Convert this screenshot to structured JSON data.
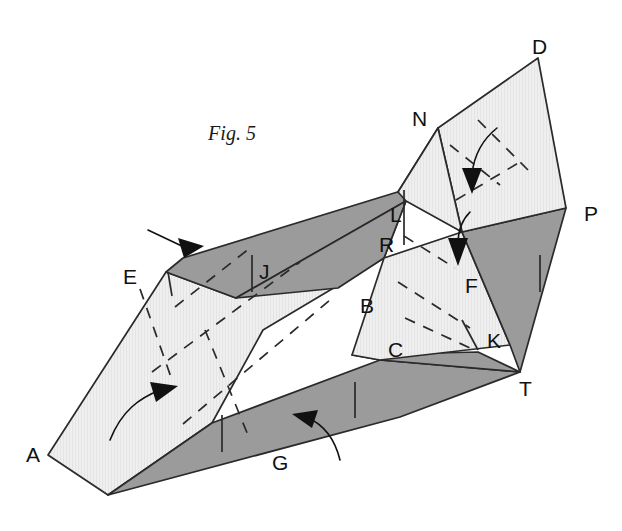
{
  "figure": {
    "caption": "Fig. 5",
    "caption_pos": {
      "x": 232,
      "y": 140
    }
  },
  "colors": {
    "light_face": "#efefef",
    "dark_face": "#9b9b9b",
    "line": "#2a2a2a",
    "background": "#ffffff",
    "arrow": "#111111"
  },
  "vertex_labels": [
    {
      "name": "A",
      "text": "A",
      "x": 26,
      "y": 462
    },
    {
      "name": "E",
      "text": "E",
      "x": 123,
      "y": 284
    },
    {
      "name": "J",
      "text": "J",
      "x": 259,
      "y": 279
    },
    {
      "name": "L",
      "text": "L",
      "x": 390,
      "y": 222
    },
    {
      "name": "R",
      "text": "R",
      "x": 379,
      "y": 252
    },
    {
      "name": "B",
      "text": "B",
      "x": 360,
      "y": 313
    },
    {
      "name": "N",
      "text": "N",
      "x": 412,
      "y": 126
    },
    {
      "name": "D",
      "text": "D",
      "x": 532,
      "y": 54
    },
    {
      "name": "P",
      "text": "P",
      "x": 584,
      "y": 221
    },
    {
      "name": "F",
      "text": "F",
      "x": 465,
      "y": 293
    },
    {
      "name": "C",
      "text": "C",
      "x": 388,
      "y": 357
    },
    {
      "name": "K",
      "text": "K",
      "x": 487,
      "y": 348
    },
    {
      "name": "T",
      "text": "T",
      "x": 519,
      "y": 396
    },
    {
      "name": "G",
      "text": "G",
      "x": 272,
      "y": 470
    }
  ],
  "faces": [
    {
      "name": "front-left-large-panel",
      "style": "light",
      "points": "48,455 166,272 236,298 406,201 384,258 263,330 212,423 108,495"
    },
    {
      "name": "left-top-dark-band",
      "style": "dark",
      "points": "166,272 183,258 404,190 406,201 236,298"
    },
    {
      "name": "mid-dark-wedge-B",
      "style": "dark",
      "points": "236,298 406,201 384,258 338,288"
    },
    {
      "name": "bottom-dark-band-G",
      "style": "dark",
      "points": "108,495 212,423 380,360 520,372 400,417"
    },
    {
      "name": "bottom-dark-band-C",
      "style": "dark",
      "points": "352,355 380,360 520,372 478,352"
    },
    {
      "name": "right-light-panel-F",
      "style": "light",
      "points": "384,258 462,232 510,345 380,360 352,355"
    },
    {
      "name": "dark-triangle-P-T",
      "style": "dark",
      "points": "462,232 566,208 520,372 510,345"
    },
    {
      "name": "dark-small-N",
      "style": "dark",
      "points": "438,128 398,192 462,232"
    },
    {
      "name": "light-panel-N-D-P",
      "style": "light",
      "points": "438,128 538,58 566,208 462,232"
    },
    {
      "name": "small-light-wedge-L",
      "style": "light",
      "points": "398,192 438,128 462,232 406,201"
    }
  ],
  "fold_lines": [
    {
      "name": "fold-left-upper",
      "d": "M 175,307 L 250,248"
    },
    {
      "name": "fold-left-mid",
      "d": "M 152,372 L 300,262"
    },
    {
      "name": "fold-left-lower",
      "d": "M 183,424 L 330,300"
    },
    {
      "name": "fold-left-vert",
      "d": "M 140,289 L 172,380"
    },
    {
      "name": "fold-left-vert2",
      "d": "M 205,330 L 250,440"
    },
    {
      "name": "fold-right-a",
      "d": "M 404,236 L 455,268"
    },
    {
      "name": "fold-right-b",
      "d": "M 398,282 L 470,328"
    },
    {
      "name": "fold-right-c",
      "d": "M 405,318 L 470,348"
    },
    {
      "name": "fold-ND-a",
      "d": "M 450,145 L 500,185"
    },
    {
      "name": "fold-ND-b",
      "d": "M 478,120 L 528,170"
    },
    {
      "name": "fold-ND-c",
      "d": "M 456,200 L 520,162"
    }
  ],
  "tick_marks": [
    {
      "name": "tick-J",
      "d": "M 252,255 L 252,292"
    },
    {
      "name": "tick-L",
      "d": "M 404,190 L 404,245"
    },
    {
      "name": "tick-E-short",
      "d": "M 168,272 L 172,296"
    },
    {
      "name": "tick-G-left",
      "d": "M 222,415 L 222,452"
    },
    {
      "name": "tick-G-mid",
      "d": "M 355,382 L 355,418"
    },
    {
      "name": "tick-K",
      "d": "M 478,350 L 462,320"
    },
    {
      "name": "tick-P-edge",
      "d": "M 540,255 L 540,292"
    }
  ],
  "arrows": [
    {
      "name": "arrow-fold-E",
      "type": "straight",
      "tail": "M 148,230 L 186,248",
      "head": "178,238 204,246 184,258"
    },
    {
      "name": "arrow-fold-left-face",
      "type": "curved",
      "tail": "M 110,440 C 122,410 140,398 160,390",
      "head": "150,382 178,386 156,402"
    },
    {
      "name": "arrow-fold-G",
      "type": "curved",
      "tail": "M 340,460 C 334,436 322,424 308,418",
      "head": "318,410 292,414 312,428"
    },
    {
      "name": "arrow-fold-N-D",
      "type": "curved",
      "tail": "M 497,128 C 482,140 474,156 472,174",
      "head": "462,168 482,168 472,194"
    },
    {
      "name": "arrow-fold-F",
      "type": "curved",
      "tail": "M 470,212 C 462,220 458,232 458,244",
      "head": "448,238 468,238 458,266"
    }
  ]
}
